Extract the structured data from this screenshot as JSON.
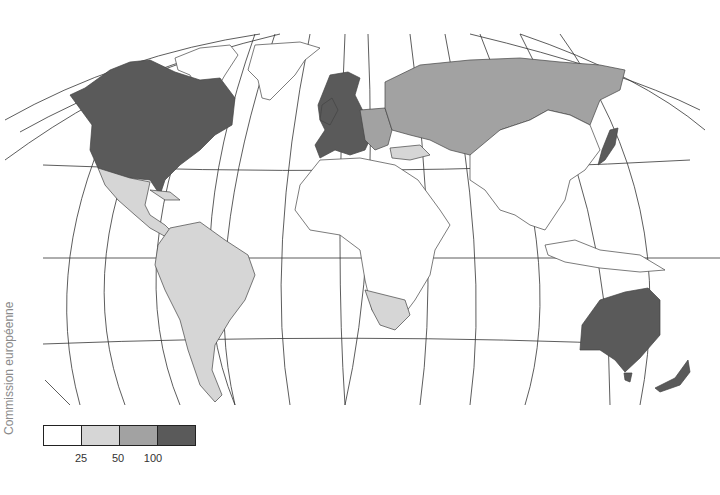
{
  "map": {
    "type": "choropleth-world-map",
    "projection": "oval-pseudocylindrical",
    "credit": "Commission européenne",
    "colors": {
      "class_0": "#ffffff",
      "class_1": "#d6d6d6",
      "class_2": "#a2a2a2",
      "class_3": "#5a5a5a"
    },
    "regions": [
      {
        "name": "North America (USA, Canada)",
        "class": 3
      },
      {
        "name": "Western & Northern Europe",
        "class": 3
      },
      {
        "name": "Japan",
        "class": 3
      },
      {
        "name": "Australia",
        "class": 3
      },
      {
        "name": "New Zealand",
        "class": 3
      },
      {
        "name": "Russia / former USSR",
        "class": 2
      },
      {
        "name": "Eastern Europe",
        "class": 2
      },
      {
        "name": "Mexico & Central America",
        "class": 1
      },
      {
        "name": "South America",
        "class": 1
      },
      {
        "name": "Turkey",
        "class": 1
      },
      {
        "name": "Middle East (Iran, Arabian Peninsula)",
        "class": 1
      },
      {
        "name": "Southern Africa (Namibia, South Africa)",
        "class": 1
      },
      {
        "name": "Greenland",
        "class": 0
      },
      {
        "name": "Africa (rest)",
        "class": 0
      },
      {
        "name": "China & Mongolia",
        "class": 0
      },
      {
        "name": "South & Southeast Asia",
        "class": 0
      }
    ]
  },
  "legend": {
    "classes": [
      {
        "range": "< 25",
        "color": "#ffffff"
      },
      {
        "range": "25 – 50",
        "color": "#d6d6d6"
      },
      {
        "range": "50 – 100",
        "color": "#a2a2a2"
      },
      {
        "range": "> 100",
        "color": "#5a5a5a"
      }
    ],
    "ticks": [
      "25",
      "50",
      "100"
    ]
  }
}
